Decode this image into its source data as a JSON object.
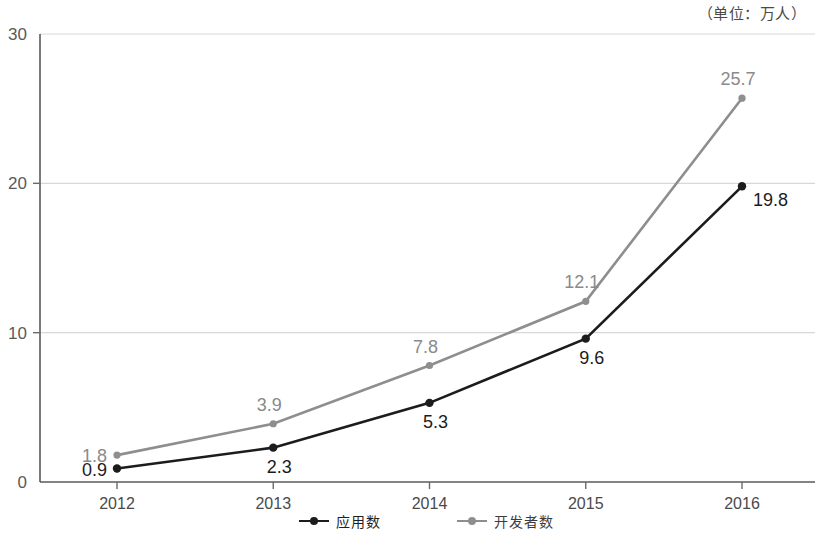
{
  "unit_note": "（单位：万人）",
  "legend": {
    "position": "bottom-center",
    "entries": [
      {
        "label": "应用数",
        "color": "#1c1c1c",
        "icon": "line-marker-icon"
      },
      {
        "label": "开发者数",
        "color": "#8e8e8e",
        "icon": "line-marker-icon"
      }
    ]
  },
  "axes": {
    "y_ticks": [
      "30",
      "20",
      "10",
      "0"
    ],
    "x_ticks": [
      "2012",
      "2013",
      "2014",
      "2015",
      "2016"
    ]
  },
  "chart_data": {
    "type": "line",
    "title": "",
    "subtitle": "",
    "xlabel": "",
    "ylabel": "",
    "unit": "万人",
    "unit_annotation": "（单位：万人）",
    "categories": [
      "2012",
      "2013",
      "2014",
      "2015",
      "2016"
    ],
    "x": [
      2012,
      2013,
      2014,
      2015,
      2016
    ],
    "ylim": [
      0,
      30
    ],
    "yticks": [
      0,
      10,
      20,
      30
    ],
    "grid": "horizontal",
    "legend_position": "bottom-center",
    "series": [
      {
        "name": "应用数",
        "color": "#1c1c1c",
        "marker": "circle",
        "values": [
          0.9,
          2.3,
          5.3,
          9.6,
          19.8
        ],
        "data_labels": [
          "0.9",
          "2.3",
          "5.3",
          "9.6",
          "19.8"
        ],
        "label_positions": [
          "left",
          "below",
          "below",
          "below",
          "right"
        ]
      },
      {
        "name": "开发者数",
        "color": "#8e8e8e",
        "marker": "circle",
        "values": [
          1.8,
          3.9,
          7.8,
          12.1,
          25.7
        ],
        "data_labels": [
          "1.8",
          "3.9",
          "7.8",
          "12.1",
          "25.7"
        ],
        "label_positions": [
          "left",
          "above",
          "above",
          "above",
          "above"
        ]
      }
    ]
  }
}
